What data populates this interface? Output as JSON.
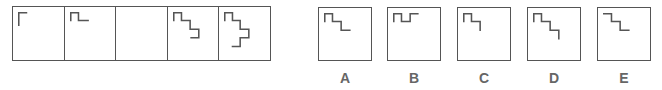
{
  "puzzle": {
    "type": "figure-sequence",
    "stroke_color": "#555555",
    "sequence": [
      {
        "position": 1,
        "figure": "corner",
        "points": "6,19 6,6 14,6"
      },
      {
        "position": 2,
        "figure": "single-step",
        "points": "6,14 6,6 14,6 14,14 24,14"
      },
      {
        "position": 3,
        "figure": "blank",
        "points": ""
      },
      {
        "position": 4,
        "figure": "double-step",
        "points": "6,14 6,6 14,6 14,14 23,14 23,23 32,23 32,32 24,32"
      },
      {
        "position": 5,
        "figure": "triple-step",
        "points": "6,14 6,6 14,6 14,14 22,14 22,23 31,23 31,32 22,32 22,41 14,41"
      }
    ],
    "options": [
      {
        "label": "A",
        "points": "6,14 6,6 14,6 14,14 23,14 23,23 32,23"
      },
      {
        "label": "B",
        "points": "6,14 6,6 14,6 14,14 23,14 23,6 31,6"
      },
      {
        "label": "C",
        "points": "6,14 6,6 14,6 14,14 23,14 23,23"
      },
      {
        "label": "D",
        "points": "6,14 6,6 14,6 14,14 23,14 23,23 32,23 32,32"
      },
      {
        "label": "E",
        "points": "6,6 14,6 14,14 23,14 23,23 32,23"
      }
    ]
  }
}
